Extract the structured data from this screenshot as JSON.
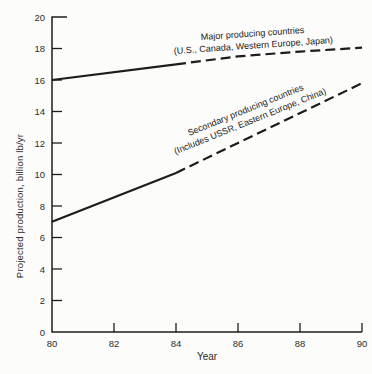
{
  "figure": {
    "background": "#fcfcfa",
    "ink": "#1c1c1c"
  },
  "chart_data": {
    "type": "line",
    "title": "",
    "xlabel": "Year",
    "ylabel": "Projected production, billion lb/yr",
    "xlim": [
      80,
      90
    ],
    "ylim": [
      0,
      20
    ],
    "x_ticks": [
      80,
      82,
      84,
      86,
      88,
      90
    ],
    "y_ticks": [
      0,
      2,
      4,
      6,
      8,
      10,
      12,
      14,
      16,
      18,
      20
    ],
    "grid": false,
    "legend_position": "inline-annotations",
    "series": [
      {
        "name": "Major producing countries",
        "annotation_line1": "Major producing countries",
        "annotation_line2": "(U.S., Canada, Western Europe, Japan)",
        "segments": [
          {
            "style": "solid",
            "points": [
              [
                80,
                16.0
              ],
              [
                84,
                17.0
              ]
            ]
          },
          {
            "style": "dashed",
            "points": [
              [
                84,
                17.0
              ],
              [
                86,
                17.5
              ],
              [
                88,
                17.8
              ],
              [
                90,
                18.05
              ]
            ]
          }
        ]
      },
      {
        "name": "Secondary producing countries",
        "annotation_line1": "Secondary producing countries",
        "annotation_line2": "(Includes USSR, Eastern Europe, China)",
        "segments": [
          {
            "style": "solid",
            "points": [
              [
                80,
                7.0
              ],
              [
                84,
                10.1
              ]
            ]
          },
          {
            "style": "dashed",
            "points": [
              [
                84,
                10.1
              ],
              [
                90,
                15.8
              ]
            ]
          }
        ]
      }
    ]
  }
}
